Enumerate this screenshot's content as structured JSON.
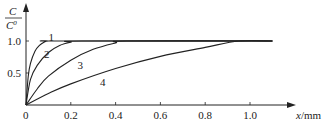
{
  "chart_data": {
    "type": "line",
    "title": "",
    "xlabel": "x/mm",
    "ylabel": "C/C0",
    "xlim": [
      0,
      1.2
    ],
    "ylim": [
      0,
      1.1
    ],
    "x_ticks": [
      "0",
      "0.2",
      "0.4",
      "0.6",
      "0.8",
      "1.0"
    ],
    "y_ticks": [
      "0.5",
      "1.0"
    ],
    "grid": false,
    "legend": "inline curve labels",
    "series": [
      {
        "name": "1",
        "x": [
          0,
          0.01,
          0.02,
          0.04,
          0.06,
          0.08,
          0.1,
          0.15,
          1.1
        ],
        "values": [
          0,
          0.45,
          0.65,
          0.84,
          0.93,
          0.98,
          1.0,
          1.0,
          1.0
        ]
      },
      {
        "name": "2",
        "x": [
          0,
          0.02,
          0.05,
          0.1,
          0.15,
          0.2,
          0.25,
          1.1
        ],
        "values": [
          0,
          0.4,
          0.62,
          0.82,
          0.93,
          0.98,
          1.0,
          1.0
        ]
      },
      {
        "name": "3",
        "x": [
          0,
          0.05,
          0.1,
          0.2,
          0.3,
          0.4,
          0.45,
          1.1
        ],
        "values": [
          0,
          0.25,
          0.45,
          0.7,
          0.87,
          0.97,
          1.0,
          1.0
        ]
      },
      {
        "name": "4",
        "x": [
          0,
          0.1,
          0.2,
          0.4,
          0.6,
          0.8,
          0.95,
          1.1
        ],
        "values": [
          0,
          0.18,
          0.33,
          0.57,
          0.76,
          0.9,
          1.0,
          1.0
        ]
      }
    ]
  },
  "labels": {
    "y_num": "C",
    "y_den": "C",
    "y_den_sup": "0",
    "x_axis": "x",
    "x_unit": "/mm",
    "origin": "0",
    "curve_labels": [
      "1",
      "2",
      "3",
      "4"
    ]
  }
}
